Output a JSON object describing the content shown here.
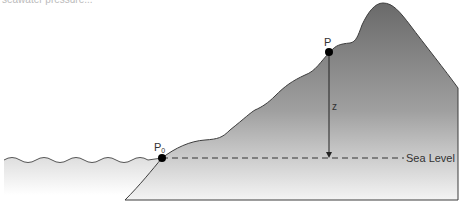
{
  "caption_fragment": "seawater pressure...",
  "labels": {
    "p0": "P",
    "p0_sub": "0",
    "p": "P",
    "z": "z",
    "sea_level": "Sea Level"
  },
  "colors": {
    "mountain_top": "#6e6e6e",
    "mountain_bottom": "#f2f2f2",
    "water": "#e6e6e6",
    "outline": "#444444",
    "point": "#000000"
  }
}
